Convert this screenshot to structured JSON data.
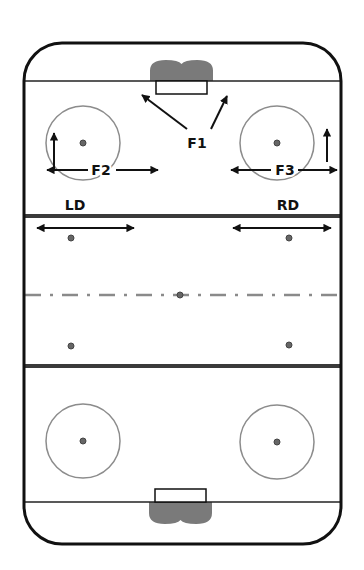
{
  "diagram": {
    "type": "hockey-rink-positions",
    "colors": {
      "board": "#111111",
      "goal_line": "#222222",
      "blue_line": "#3a3a3a",
      "center_line": "#8a8a8a",
      "circle": "#8c8c8c",
      "dot": "#666666",
      "crease": "#7a7a7a",
      "arrow": "#111111",
      "text": "#111111"
    },
    "rink": {
      "x": 24,
      "y": 43,
      "w": 317,
      "h": 501,
      "r": 38
    },
    "goal_lines": [
      81,
      502
    ],
    "blue_lines": [
      216,
      366
    ],
    "center_line_y": 295,
    "nets": [
      {
        "id": "top-net",
        "x": 156,
        "y": 81,
        "w": 51,
        "h": 13,
        "crease_y": 60,
        "crease_dir": "up"
      },
      {
        "id": "bottom-net",
        "x": 155,
        "y": 489,
        "w": 51,
        "h": 13,
        "crease_y": 524,
        "crease_dir": "down"
      }
    ],
    "faceoff_circles": [
      {
        "id": "top-left",
        "cx": 83,
        "cy": 143,
        "r": 37
      },
      {
        "id": "top-right",
        "cx": 277,
        "cy": 143,
        "r": 37
      },
      {
        "id": "bottom-left",
        "cx": 83,
        "cy": 441,
        "r": 37
      },
      {
        "id": "bottom-right",
        "cx": 277,
        "cy": 442,
        "r": 37
      }
    ],
    "dots": [
      {
        "id": "neutral-top-left",
        "cx": 71,
        "cy": 238
      },
      {
        "id": "neutral-top-right",
        "cx": 289,
        "cy": 238
      },
      {
        "id": "center",
        "cx": 180,
        "cy": 295
      },
      {
        "id": "neutral-bottom-left",
        "cx": 71,
        "cy": 346
      },
      {
        "id": "neutral-bottom-right",
        "cx": 289,
        "cy": 345
      }
    ],
    "labels": [
      {
        "id": "F1",
        "text": "F1",
        "x": 197,
        "y": 148
      },
      {
        "id": "F2",
        "text": "F2",
        "x": 101,
        "y": 175
      },
      {
        "id": "F3",
        "text": "F3",
        "x": 285,
        "y": 175
      },
      {
        "id": "LD",
        "text": "LD",
        "x": 75,
        "y": 210
      },
      {
        "id": "RD",
        "text": "RD",
        "x": 288,
        "y": 210
      }
    ],
    "arrows": [
      {
        "id": "f1-left",
        "x1": 187,
        "y1": 129,
        "x2": 142,
        "y2": 95
      },
      {
        "id": "f1-right",
        "x1": 211,
        "y1": 129,
        "x2": 227,
        "y2": 96
      },
      {
        "id": "f2-up",
        "x1": 54,
        "y1": 170,
        "x2": 54,
        "y2": 133
      },
      {
        "id": "f2-left",
        "x1": 88,
        "y1": 170,
        "x2": 47,
        "y2": 170
      },
      {
        "id": "f2-right",
        "x1": 116,
        "y1": 170,
        "x2": 158,
        "y2": 170
      },
      {
        "id": "f3-up",
        "x1": 327,
        "y1": 162,
        "x2": 327,
        "y2": 129
      },
      {
        "id": "f3-left",
        "x1": 271,
        "y1": 170,
        "x2": 231,
        "y2": 170
      },
      {
        "id": "f3-right",
        "x1": 298,
        "y1": 170,
        "x2": 337,
        "y2": 170
      },
      {
        "id": "ld-left",
        "x1": 85,
        "y1": 228,
        "x2": 37,
        "y2": 228
      },
      {
        "id": "ld-right",
        "x1": 85,
        "y1": 228,
        "x2": 134,
        "y2": 228
      },
      {
        "id": "rd-left",
        "x1": 282,
        "y1": 228,
        "x2": 233,
        "y2": 228
      },
      {
        "id": "rd-right",
        "x1": 282,
        "y1": 228,
        "x2": 331,
        "y2": 228
      }
    ]
  }
}
